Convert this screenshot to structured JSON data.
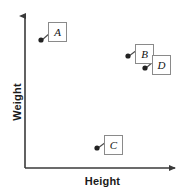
{
  "chart_data": {
    "type": "scatter",
    "title": "",
    "xlabel": "Height",
    "ylabel": "Weight",
    "xlim": [
      0,
      100
    ],
    "ylim": [
      0,
      100
    ],
    "grid": false,
    "legend": null,
    "axis_ticks": {
      "x": [],
      "y": []
    },
    "axis_style": {
      "arrow_x": true,
      "arrow_y": true,
      "color": "#3a3a3a"
    },
    "marker_color": "#222222",
    "points": [
      {
        "label": "A",
        "x": 10,
        "y": 83,
        "px": 41,
        "py": 40,
        "box_px": 48,
        "box_py": 22,
        "box_w": 19,
        "box_h": 20
      },
      {
        "label": "B",
        "x": 66,
        "y": 72,
        "px": 128,
        "py": 56,
        "box_px": 135,
        "box_py": 44,
        "box_w": 19,
        "box_h": 20
      },
      {
        "label": "D",
        "x": 77,
        "y": 64,
        "px": 145,
        "py": 68,
        "box_px": 152,
        "box_py": 55,
        "box_w": 19,
        "box_h": 20
      },
      {
        "label": "C",
        "x": 46,
        "y": 13,
        "px": 97,
        "py": 148,
        "box_px": 104,
        "box_py": 135,
        "box_w": 19,
        "box_h": 20
      }
    ]
  }
}
